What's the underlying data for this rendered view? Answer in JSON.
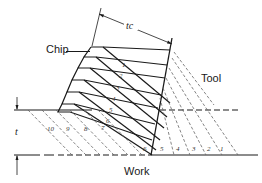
{
  "diagram": {
    "type": "orthogonal-cutting-chip-formation",
    "labels": {
      "chip": "Chip",
      "tool": "Tool",
      "work": "Work",
      "uncut_thickness": "t",
      "chip_thickness": "tc"
    },
    "chip_segment_numbers": [
      "1",
      "2",
      "3",
      "4",
      "5",
      "6"
    ],
    "work_segment_numbers_upper": [
      "10",
      "9",
      "8",
      "7"
    ],
    "work_segment_numbers_lower": [
      "6",
      "5",
      "4",
      "3",
      "2",
      "1"
    ],
    "colors": {
      "line": "#1a1a1a",
      "dashed": "#555555",
      "background": "#ffffff"
    }
  }
}
